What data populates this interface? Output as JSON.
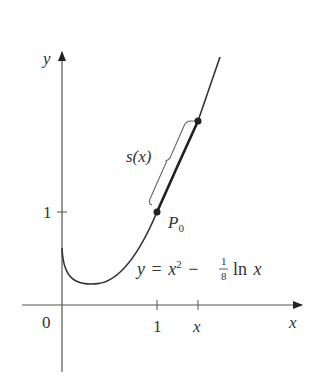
{
  "diagram": {
    "type": "function-graph",
    "equation": {
      "lhs": "y",
      "eq": "=",
      "x_var": "x",
      "exponent": "2",
      "minus": "−",
      "frac_num": "1",
      "frac_den": "8",
      "ln": "ln",
      "arg": "x"
    },
    "axes": {
      "x_label": "x",
      "y_label": "y",
      "origin_label": "0",
      "x_ticks": [
        {
          "label": "1",
          "value": 1
        },
        {
          "label": "x",
          "value": 1.43
        }
      ],
      "y_ticks": [
        {
          "label": "1",
          "value": 1
        }
      ]
    },
    "points": [
      {
        "name": "P0",
        "label_main": "P",
        "label_sub": "0",
        "x": 1,
        "y": 1
      },
      {
        "name": "upper",
        "x": 1.43,
        "y": 2.0
      }
    ],
    "arc_length_label": "s(x)",
    "colors": {
      "curve": "#333333",
      "axes": "#555555",
      "bracket": "#666666",
      "text": "#333333"
    }
  }
}
